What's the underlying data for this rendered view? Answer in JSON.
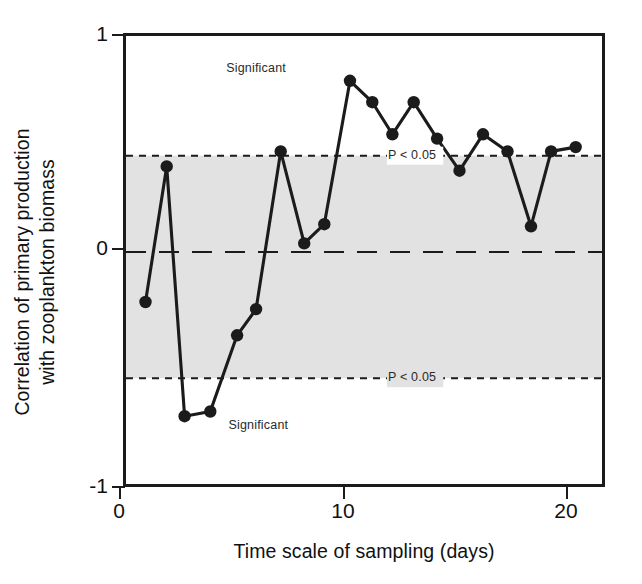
{
  "chart_data": {
    "type": "line",
    "title": "",
    "xlabel": "Time scale of sampling (days)",
    "ylabel": "Correlation of primary production\nwith zooplankton biomass",
    "xlim": [
      0,
      21.6
    ],
    "ylim": [
      -1,
      1
    ],
    "xticks": [
      0,
      10,
      20
    ],
    "xtick_labels": [
      "0",
      "10",
      "20"
    ],
    "yticks": [
      1,
      0,
      -1
    ],
    "ytick_labels": [
      "1",
      "0",
      "-1"
    ],
    "grid": false,
    "legend": "none",
    "series": [
      {
        "name": "Correlation",
        "marker": "filled-circle",
        "color": "#1b1b1b",
        "x": [
          1.05,
          2.0,
          2.8,
          3.95,
          5.15,
          6.0,
          7.1,
          8.15,
          9.05,
          10.2,
          11.2,
          12.1,
          13.05,
          14.1,
          15.1,
          16.15,
          17.25,
          18.3,
          19.2,
          20.3
        ],
        "values": [
          -0.21,
          0.4,
          -0.69,
          -0.67,
          -0.35,
          -0.24,
          0.47,
          0.04,
          0.13,
          0.8,
          0.7,
          0.55,
          0.7,
          0.53,
          0.38,
          0.55,
          0.47,
          0.12,
          0.47,
          0.49
        ]
      }
    ],
    "reference_lines": [
      {
        "name": "upper-significance",
        "y": 0.45,
        "style": "dotted",
        "label": "P < 0.05"
      },
      {
        "name": "zero-line",
        "y": 0.0,
        "style": "dashed",
        "label": ""
      },
      {
        "name": "lower-significance",
        "y": -0.53,
        "style": "dotted",
        "label": "P < 0.05"
      }
    ],
    "shaded_band": {
      "name": "non-significant-band",
      "from": -0.53,
      "to": 0.45,
      "color": "#e2e2e2"
    },
    "annotations": [
      {
        "name": "significant-upper",
        "text": "Significant",
        "x": 6.0,
        "y": 0.855
      },
      {
        "name": "upper-p-label",
        "text": "P < 0.05",
        "x": 11.9,
        "y": 0.45
      },
      {
        "name": "lower-p-label",
        "text": "P < 0.05",
        "x": 11.9,
        "y": -0.53
      },
      {
        "name": "significant-lower",
        "text": "Significant",
        "x": 6.1,
        "y": -0.73
      }
    ]
  },
  "labels": {
    "x_axis_title": "Time scale of sampling (days)",
    "y_axis_title": "Correlation of primary production\nwith zooplankton biomass",
    "ytick_1": "1",
    "ytick_0": "0",
    "ytick_neg1": "-1",
    "xtick_0": "0",
    "xtick_10": "10",
    "xtick_20": "20",
    "significant_upper": "Significant",
    "significant_lower": "Significant",
    "p_upper": "P < 0.05",
    "p_lower": "P < 0.05"
  },
  "colors": {
    "axis": "#1b1b1b",
    "line": "#1b1b1b",
    "marker": "#1b1b1b",
    "band": "#e2e2e2",
    "background": "#ffffff"
  }
}
